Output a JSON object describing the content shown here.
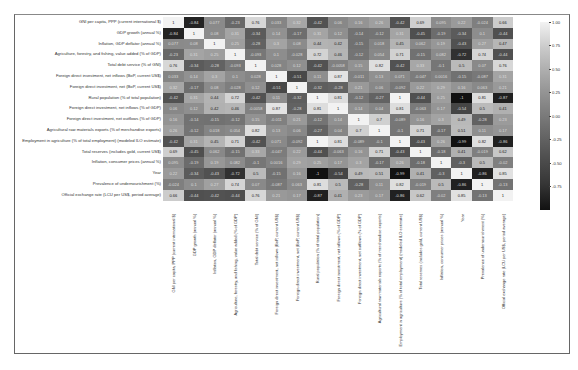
{
  "chart_data": {
    "type": "heatmap",
    "title": "",
    "xlabel": "",
    "ylabel": "",
    "colormap": "grayscale",
    "vmin": -1.0,
    "vmax": 1.0,
    "labels": [
      "GNI per capita, PPP (current international $)",
      "GDP growth (annual %)",
      "Inflation, GDP deflator (annual %)",
      "Agriculture, forestry, and fishing, value added (% of GDP)",
      "Total debt service (% of GNI)",
      "Foreign direct investment, net inflows (BoP, current US$)",
      "Foreign direct investment, net (BoP, current US$)",
      "Rural population (% of total population)",
      "Foreign direct investment, net inflows (% of GDP)",
      "Foreign direct investment, net outflows (% of GDP)",
      "Agricultural raw materials exports (% of merchandise exports)",
      "Employment in agriculture (% of total employment) (modeled ILO estimate)",
      "Total reserves (includes gold, current US$)",
      "Inflation, consumer prices (annual %)",
      "Year",
      "Prevalence of undernourishment (%)",
      "Official exchange rate (LCU per US$, period average)"
    ],
    "matrix": [
      [
        "1",
        "-0.84",
        "0.077",
        "-0.23",
        "0.76",
        "0.033",
        "0.32",
        "-0.42",
        "0.06",
        "0.16",
        "0.26",
        "-0.42",
        "0.69",
        "0.095",
        "0.22",
        "-0.024",
        "0.66"
      ],
      [
        "-0.84",
        "1",
        "0.08",
        "0.31",
        "-0.34",
        "0.14",
        "-0.17",
        "0.31",
        "0.12",
        "-0.14",
        "-0.12",
        "0.31",
        "-0.45",
        "-0.19",
        "-0.34",
        "0.1",
        "-0.44"
      ],
      [
        "0.077",
        "0.08",
        "1",
        "0.25",
        "-0.28",
        "0.3",
        "0.08",
        "0.44",
        "0.42",
        "-0.15",
        "0.018",
        "0.45",
        "0.062",
        "0.19",
        "-0.43",
        "0.27",
        "0.47"
      ],
      [
        "-0.23",
        "0.31",
        "0.25",
        "1",
        "-0.093",
        "0.1",
        "-0.028",
        "0.72",
        "0.46",
        "-0.12",
        "0.054",
        "0.71",
        "-0.15",
        "0.082",
        "-0.72",
        "0.74",
        "-0.44"
      ],
      [
        "0.76",
        "-0.34",
        "-0.28",
        "-0.093",
        "1",
        "0.028",
        "0.12",
        "-0.42",
        "-0.0058",
        "0.15",
        "0.82",
        "-0.42",
        "0.33",
        "-0.1",
        "0.5",
        "0.07",
        "0.76"
      ],
      [
        "0.033",
        "0.14",
        "0.3",
        "0.1",
        "0.028",
        "1",
        "-0.51",
        "0.11",
        "0.87",
        "-0.011",
        "0.13",
        "0.071",
        "-0.047",
        "0.0016",
        "-0.15",
        "-0.087",
        "0.31"
      ],
      [
        "0.32",
        "-0.17",
        "0.08",
        "-0.028",
        "0.12",
        "-0.51",
        "1",
        "-0.32",
        "-0.28",
        "0.21",
        "0.06",
        "-0.092",
        "0.22",
        "0.29",
        "0.16",
        "0.063",
        "0.21"
      ],
      [
        "-0.42",
        "0.31",
        "0.44",
        "0.72",
        "-0.42",
        "0.11",
        "-0.32",
        "1",
        "0.81",
        "-0.12",
        "-0.27",
        "1",
        "-0.44",
        "0.25",
        "-1",
        "0.81",
        "-0.87"
      ],
      [
        "0.06",
        "0.12",
        "0.42",
        "0.46",
        "-0.0058",
        "0.87",
        "-0.28",
        "0.81",
        "1",
        "0.14",
        "0.04",
        "0.81",
        "-0.063",
        "0.17",
        "-0.54",
        "0.5",
        "0.41"
      ],
      [
        "0.16",
        "-0.14",
        "-0.15",
        "-0.12",
        "0.15",
        "-0.011",
        "0.21",
        "-0.12",
        "0.14",
        "1",
        "0.7",
        "-0.089",
        "0.16",
        "0.3",
        "0.49",
        "-0.28",
        "0.23"
      ],
      [
        "0.26",
        "-0.12",
        "0.018",
        "0.054",
        "0.82",
        "0.13",
        "0.06",
        "-0.27",
        "0.04",
        "0.7",
        "1",
        "-0.1",
        "0.71",
        "-0.17",
        "0.51",
        "0.11",
        "0.17"
      ],
      [
        "-0.42",
        "0.31",
        "0.45",
        "0.71",
        "-0.42",
        "0.071",
        "-0.092",
        "1",
        "0.81",
        "-0.089",
        "-0.1",
        "1",
        "-0.43",
        "0.26",
        "-0.99",
        "0.82",
        "-0.86"
      ],
      [
        "0.69",
        "-0.45",
        "0.062",
        "-0.15",
        "0.33",
        "-0.047",
        "0.22",
        "-0.44",
        "-0.063",
        "0.16",
        "0.71",
        "-0.43",
        "1",
        "-0.18",
        "0.41",
        "-0.019",
        "0.62"
      ],
      [
        "0.095",
        "-0.19",
        "0.19",
        "0.082",
        "-0.1",
        "0.0016",
        "0.29",
        "0.25",
        "0.17",
        "0.3",
        "-0.17",
        "0.26",
        "-0.18",
        "1",
        "-0.3",
        "0.5",
        "-0.02"
      ],
      [
        "0.22",
        "-0.34",
        "-0.43",
        "-0.72",
        "0.5",
        "-0.15",
        "0.16",
        "-1",
        "-0.54",
        "0.49",
        "0.51",
        "-0.99",
        "0.41",
        "-0.3",
        "1",
        "-0.86",
        "0.85"
      ],
      [
        "-0.024",
        "0.1",
        "0.27",
        "0.74",
        "0.07",
        "-0.087",
        "0.063",
        "0.81",
        "0.5",
        "-0.28",
        "0.11",
        "0.82",
        "-0.019",
        "0.5",
        "-0.86",
        "1",
        "-0.13"
      ],
      [
        "0.66",
        "-0.44",
        "-0.42",
        "-0.44",
        "0.76",
        "0.21",
        "0.17",
        "-0.87",
        "0.41",
        "0.23",
        "0.17",
        "-0.86",
        "0.62",
        "-0.02",
        "0.85",
        "-0.13",
        "1"
      ]
    ],
    "colorbar_ticks": [
      "1.00",
      "0.75",
      "0.50",
      "0.25",
      "0.00",
      "-0.25",
      "-0.50",
      "-0.75"
    ]
  }
}
